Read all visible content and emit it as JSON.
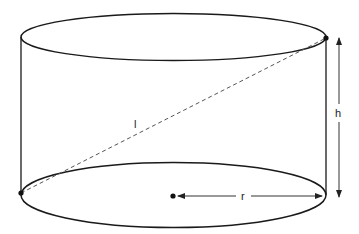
{
  "diagram": {
    "type": "cylinder",
    "labels": {
      "height": "h",
      "slant": "l",
      "radius": "r"
    },
    "colors": {
      "stroke": "#1a1a1a",
      "dashed": "#555555",
      "arrow": "#333333"
    }
  }
}
